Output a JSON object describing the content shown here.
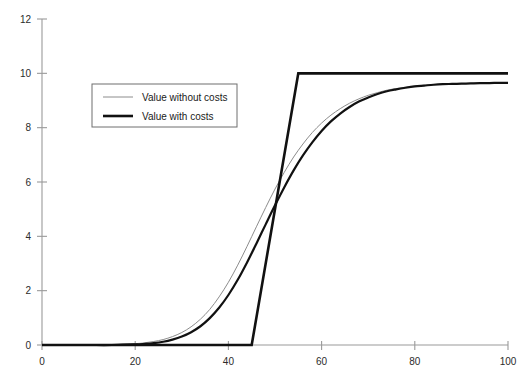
{
  "chart_data": {
    "type": "line",
    "title": "",
    "subtitle": "",
    "xlabel": "",
    "ylabel": "",
    "xlim": [
      0,
      100
    ],
    "ylim": [
      0,
      12
    ],
    "xticks": [
      0,
      20,
      40,
      60,
      80,
      100
    ],
    "yticks": [
      0,
      2,
      4,
      6,
      8,
      10,
      12
    ],
    "xtick_labels": [
      "0",
      "20",
      "40",
      "60",
      "80",
      "100"
    ],
    "ytick_labels": [
      "0",
      "2",
      "4",
      "6",
      "8",
      "10",
      "12"
    ],
    "grid": false,
    "legend_position": "upper-left",
    "legend_entries": [
      {
        "label": "Value without costs",
        "color": "#8c8c8c",
        "width": 1
      },
      {
        "label": "Value with costs",
        "color": "#111111",
        "width": 2.6
      }
    ],
    "series": [
      {
        "name": "Value without costs",
        "style": "thin-grey-sigmoid",
        "color": "#8c8c8c",
        "width": 1,
        "x": [
          0,
          5,
          10,
          15,
          20,
          22,
          24,
          26,
          28,
          30,
          32,
          34,
          36,
          38,
          40,
          42,
          44,
          46,
          48,
          50,
          52,
          54,
          56,
          58,
          60,
          62,
          64,
          66,
          68,
          70,
          72,
          74,
          76,
          78,
          80,
          82,
          84,
          86,
          88,
          90,
          92,
          94,
          96,
          98,
          100
        ],
        "y": [
          0.0,
          0.0,
          0.0,
          0.01,
          0.05,
          0.08,
          0.13,
          0.2,
          0.31,
          0.46,
          0.67,
          0.95,
          1.31,
          1.77,
          2.31,
          2.94,
          3.63,
          4.35,
          5.06,
          5.74,
          6.36,
          6.92,
          7.4,
          7.82,
          8.17,
          8.46,
          8.7,
          8.9,
          9.06,
          9.19,
          9.29,
          9.38,
          9.44,
          9.49,
          9.53,
          9.56,
          9.58,
          9.6,
          9.61,
          9.62,
          9.63,
          9.64,
          9.64,
          9.65,
          9.65
        ]
      },
      {
        "name": "Value with costs",
        "style": "thick-black-sigmoid",
        "color": "#111111",
        "width": 2.2,
        "x": [
          0,
          5,
          10,
          15,
          20,
          22,
          24,
          26,
          28,
          30,
          32,
          34,
          36,
          38,
          40,
          42,
          44,
          46,
          48,
          50,
          52,
          54,
          56,
          58,
          60,
          62,
          64,
          66,
          68,
          70,
          72,
          74,
          76,
          78,
          80,
          82,
          84,
          86,
          88,
          90,
          92,
          94,
          96,
          98,
          100
        ],
        "y": [
          0.0,
          0.0,
          0.0,
          0.0,
          0.02,
          0.04,
          0.07,
          0.12,
          0.2,
          0.31,
          0.47,
          0.69,
          0.99,
          1.37,
          1.84,
          2.4,
          3.04,
          3.73,
          4.44,
          5.14,
          5.81,
          6.43,
          6.98,
          7.46,
          7.88,
          8.23,
          8.52,
          8.76,
          8.96,
          9.11,
          9.24,
          9.34,
          9.41,
          9.47,
          9.52,
          9.55,
          9.58,
          9.6,
          9.61,
          9.62,
          9.63,
          9.64,
          9.64,
          9.65,
          9.65
        ]
      },
      {
        "name": "Value with costs",
        "style": "thick-black-piecewise",
        "color": "#111111",
        "width": 2.6,
        "x": [
          0,
          45,
          55,
          100
        ],
        "y": [
          0,
          0,
          10,
          10
        ]
      }
    ]
  },
  "axes": {
    "x_axis_name": "x-axis",
    "y_axis_name": "y-axis"
  }
}
